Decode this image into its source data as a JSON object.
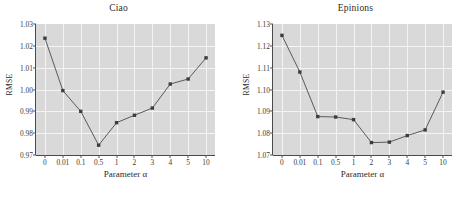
{
  "figure": {
    "background": "#ffffff",
    "plot_background": "#d9d9d9",
    "gridline_color": "#f4f4f4",
    "line_color": "#5a5a5a",
    "marker_color": "#3d3d3d"
  },
  "panels": [
    {
      "title": "Ciao",
      "xlabel": "Parameter α",
      "ylabel": "RMSE",
      "yticks": [
        "0.97",
        "0.98",
        "0.99",
        "1.00",
        "1.01",
        "1.02",
        "1.03"
      ],
      "xticks": [
        "0",
        "0.01",
        "0.1",
        "0.5",
        "1",
        "2",
        "3",
        "4",
        "5",
        "10"
      ]
    },
    {
      "title": "Epinions",
      "xlabel": "Parameter α",
      "ylabel": "RMSE",
      "yticks": [
        "1.07",
        "1.08",
        "1.09",
        "1.10",
        "1.11",
        "1.12",
        "1.13"
      ],
      "xticks": [
        "0",
        "0.01",
        "0.1",
        "0.5",
        "1",
        "2",
        "3",
        "4",
        "5",
        "10"
      ]
    }
  ],
  "chart_data": [
    {
      "type": "line",
      "title": "Ciao",
      "xlabel": "Parameter α",
      "ylabel": "RMSE",
      "categories": [
        "0",
        "0.01",
        "0.1",
        "0.5",
        "1",
        "2",
        "3",
        "4",
        "5",
        "10"
      ],
      "values": [
        1.0235,
        0.9995,
        0.99,
        0.9745,
        0.9848,
        0.9882,
        0.9915,
        1.0025,
        1.0048,
        1.0145
      ],
      "ylim": [
        0.97,
        1.03
      ],
      "yticks": [
        0.97,
        0.98,
        0.99,
        1.0,
        1.01,
        1.02,
        1.03
      ],
      "grid": true,
      "legend": "none",
      "marker": "square"
    },
    {
      "type": "line",
      "title": "Epinions",
      "xlabel": "Parameter α",
      "ylabel": "RMSE",
      "categories": [
        "0",
        "0.01",
        "0.1",
        "0.5",
        "1",
        "2",
        "3",
        "4",
        "5",
        "10"
      ],
      "values": [
        1.1248,
        1.108,
        1.0876,
        1.0874,
        1.0862,
        1.0757,
        1.0759,
        1.0789,
        1.0815,
        1.0988
      ],
      "ylim": [
        1.07,
        1.13
      ],
      "yticks": [
        1.07,
        1.08,
        1.09,
        1.1,
        1.11,
        1.12,
        1.13
      ],
      "grid": true,
      "legend": "none",
      "marker": "square"
    }
  ]
}
